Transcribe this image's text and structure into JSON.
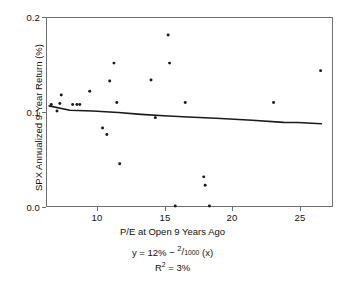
{
  "chart_data": {
    "type": "scatter",
    "title": "",
    "xlabel": "P/E at Open 9 Years Ago",
    "ylabel": "SPX Annualized 9-Year Return (%)",
    "xlim": [
      7.0,
      27.0
    ],
    "ylim": [
      0.0,
      0.2
    ],
    "xticks": [
      10,
      15,
      20,
      25
    ],
    "xtick_labels": [
      "10",
      "15",
      "20",
      "25"
    ],
    "yticks": [
      0.0,
      0.1,
      0.2
    ],
    "ytick_labels": [
      "0.0",
      "0.1",
      "0.2"
    ],
    "grid": false,
    "legend": null,
    "marker": "dot",
    "marker_color": "#1a1a1a",
    "points": [
      {
        "x": 7.3,
        "y": 0.108
      },
      {
        "x": 7.7,
        "y": 0.101
      },
      {
        "x": 7.9,
        "y": 0.109
      },
      {
        "x": 8.0,
        "y": 0.118
      },
      {
        "x": 8.8,
        "y": 0.108
      },
      {
        "x": 9.1,
        "y": 0.108
      },
      {
        "x": 9.3,
        "y": 0.108
      },
      {
        "x": 10.0,
        "y": 0.122
      },
      {
        "x": 10.9,
        "y": 0.083
      },
      {
        "x": 11.2,
        "y": 0.076
      },
      {
        "x": 11.4,
        "y": 0.133
      },
      {
        "x": 11.7,
        "y": 0.152
      },
      {
        "x": 11.9,
        "y": 0.11
      },
      {
        "x": 12.1,
        "y": 0.045
      },
      {
        "x": 14.3,
        "y": 0.134
      },
      {
        "x": 14.6,
        "y": 0.094
      },
      {
        "x": 15.5,
        "y": 0.182
      },
      {
        "x": 15.6,
        "y": 0.152
      },
      {
        "x": 16.0,
        "y": 0.0
      },
      {
        "x": 16.7,
        "y": 0.11
      },
      {
        "x": 18.0,
        "y": 0.031
      },
      {
        "x": 18.1,
        "y": 0.022
      },
      {
        "x": 18.4,
        "y": 0.0
      },
      {
        "x": 22.9,
        "y": 0.11
      },
      {
        "x": 26.2,
        "y": 0.144
      }
    ],
    "fit_line": {
      "name": "regression-line",
      "color": "#1a1a1a",
      "x_start": 7.15,
      "y_start": 0.1065,
      "x_end": 26.25,
      "y_end": 0.0875,
      "vertices": [
        {
          "x": 7.15,
          "y": 0.1065
        },
        {
          "x": 8.6,
          "y": 0.1018
        },
        {
          "x": 10.2,
          "y": 0.101
        },
        {
          "x": 12.0,
          "y": 0.0995
        },
        {
          "x": 13.6,
          "y": 0.0975
        },
        {
          "x": 15.2,
          "y": 0.096
        },
        {
          "x": 16.9,
          "y": 0.0947
        },
        {
          "x": 19.2,
          "y": 0.093
        },
        {
          "x": 21.4,
          "y": 0.0912
        },
        {
          "x": 23.6,
          "y": 0.089
        },
        {
          "x": 24.6,
          "y": 0.0889
        },
        {
          "x": 26.25,
          "y": 0.0875
        }
      ]
    },
    "annotations": {
      "equation_prefix": "y = 12% − ",
      "equation_numerator": "2",
      "equation_slash": "/",
      "equation_denominator": "1000",
      "equation_suffix": " (x)",
      "r_squared_prefix": "R",
      "r_squared_exponent": "2",
      "r_squared_value": " = 3%"
    }
  },
  "axes": {
    "y_title": "SPX Annualized 9-Year Return (%)",
    "x_title": "P/E at Open 9 Years Ago",
    "y_tick_0": "0.0",
    "y_tick_1": "0.1",
    "y_tick_2": "0.2",
    "x_tick_0": "10",
    "x_tick_1": "15",
    "x_tick_2": "20",
    "x_tick_3": "25"
  },
  "colors": {
    "frame": "#6f6f6f",
    "marker": "#1a1a1a",
    "line": "#1a1a1a",
    "text": "#111111",
    "background": "#ffffff"
  }
}
